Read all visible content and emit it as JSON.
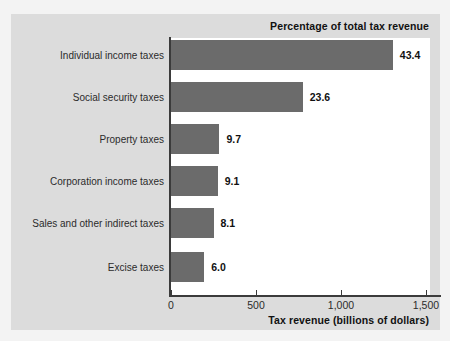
{
  "chart_data": {
    "type": "bar",
    "orientation": "horizontal",
    "title": "",
    "note": "Percentage of total tax revenue",
    "xlabel": "Tax revenue (billions of dollars)",
    "ylabel": "",
    "xlim": [
      0,
      1500
    ],
    "xticks": [
      0,
      500,
      1000,
      1500
    ],
    "xtick_labels": [
      "0",
      "500",
      "1,000",
      "1,500"
    ],
    "grid": false,
    "legend": null,
    "bar_color": "#6b6b6b",
    "categories": [
      "Individual income taxes",
      "Social security taxes",
      "Property taxes",
      "Corporation income taxes",
      "Sales and other indirect taxes",
      "Excise taxes"
    ],
    "values": [
      1305,
      775,
      285,
      275,
      250,
      195
    ],
    "data_labels": [
      "43.4",
      "23.6",
      "9.7",
      "9.1",
      "8.1",
      "6.0"
    ],
    "percent_values": [
      43.4,
      23.6,
      9.7,
      9.1,
      8.1,
      6.0
    ]
  }
}
